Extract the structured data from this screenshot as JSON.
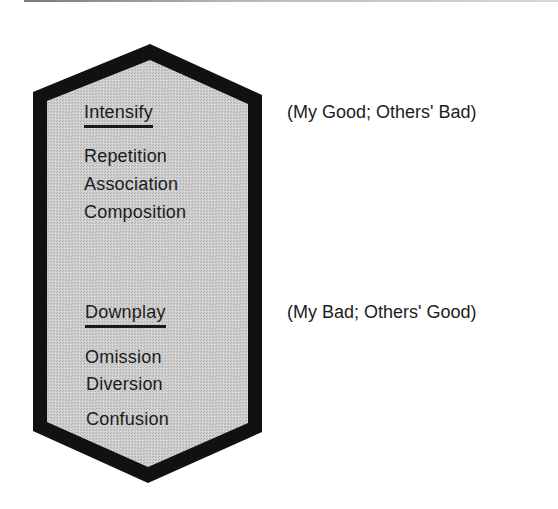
{
  "diagram": {
    "shape": "elongated-hexagon",
    "colors": {
      "border": "#111111",
      "fill": "#c9c9c9",
      "text": "#1c1c1c",
      "background": "#ffffff"
    },
    "sections": [
      {
        "heading": "Intensify",
        "items": [
          "Repetition",
          "Association",
          "Composition"
        ],
        "note": "(My Good; Others' Bad)"
      },
      {
        "heading": "Downplay",
        "items": [
          "Omission",
          "Diversion",
          "Confusion"
        ],
        "note": "(My Bad; Others' Good)"
      }
    ]
  }
}
